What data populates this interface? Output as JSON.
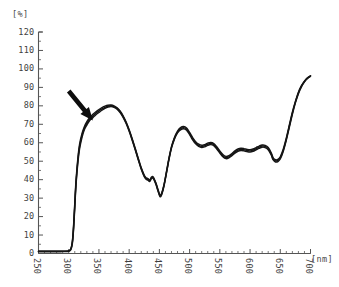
{
  "axes": {
    "y_unit_label": "[%]",
    "x_unit_label": "[nm]",
    "y_ticks": [
      "120",
      "110",
      "100",
      "90",
      "80",
      "70",
      "60",
      "50",
      "40",
      "30",
      "20",
      "10",
      "0"
    ],
    "x_ticks": [
      "250",
      "300",
      "350",
      "400",
      "450",
      "500",
      "550",
      "600",
      "650",
      "700"
    ]
  },
  "annotation": {
    "arrow_name": "down-right-arrow",
    "points_at_nm": 340,
    "points_at_percent": 72
  },
  "style": {
    "curve_color": "#151515",
    "axis_color": "#555555",
    "tick_label_color": "#3f3f3f",
    "background": "#ffffff"
  },
  "chart_data": {
    "type": "line",
    "title": "",
    "subtitle": "",
    "xlabel": "[nm]",
    "ylabel": "[%]",
    "xlim": [
      250,
      700
    ],
    "ylim": [
      0,
      120
    ],
    "grid": false,
    "legend_position": "none",
    "x_major_tick_interval": 50,
    "x_minor_tick_interval": 10,
    "y_major_tick_interval": 10,
    "annotations": [
      {
        "type": "arrow",
        "target_x": 340,
        "target_y": 72,
        "tail_x": 300,
        "tail_y": 88,
        "label": ""
      }
    ],
    "series": [
      {
        "name": "trace-1",
        "x": [
          250,
          260,
          270,
          280,
          290,
          298,
          303,
          306,
          308,
          310,
          312,
          315,
          318,
          322,
          326,
          330,
          335,
          340,
          345,
          350,
          355,
          360,
          365,
          370,
          375,
          380,
          385,
          390,
          395,
          400,
          405,
          410,
          415,
          420,
          425,
          428,
          431,
          434,
          437,
          440,
          444,
          448,
          451,
          454,
          458,
          462,
          466,
          470,
          475,
          480,
          485,
          490,
          495,
          500,
          505,
          510,
          515,
          520,
          525,
          530,
          535,
          540,
          545,
          550,
          555,
          560,
          565,
          570,
          575,
          580,
          585,
          590,
          595,
          600,
          605,
          610,
          615,
          620,
          625,
          630,
          635,
          638,
          642,
          646,
          650,
          655,
          660,
          665,
          670,
          675,
          680,
          685,
          690,
          695,
          700
        ],
        "y": [
          1.2,
          1.2,
          1.2,
          1.2,
          1.2,
          1.3,
          2.0,
          6.0,
          14.0,
          26.0,
          38.0,
          50.0,
          58.0,
          64.0,
          68.0,
          70.5,
          73.0,
          74.5,
          76.0,
          77.2,
          78.3,
          79.2,
          79.8,
          80.0,
          79.6,
          78.6,
          76.8,
          74.2,
          70.8,
          66.6,
          61.8,
          56.6,
          51.2,
          46.0,
          42.0,
          40.6,
          40.2,
          39.4,
          41.0,
          41.0,
          38.0,
          34.0,
          31.2,
          32.5,
          37.5,
          44.5,
          51.5,
          57.5,
          62.5,
          65.8,
          67.6,
          68.2,
          67.4,
          65.0,
          62.2,
          60.0,
          58.6,
          58.0,
          58.4,
          59.2,
          59.6,
          59.0,
          57.2,
          55.0,
          53.0,
          52.0,
          52.4,
          53.6,
          55.0,
          56.0,
          56.4,
          56.2,
          55.8,
          55.6,
          56.0,
          56.8,
          57.6,
          58.2,
          58.0,
          56.8,
          54.0,
          51.4,
          50.2,
          50.4,
          51.8,
          56.0,
          62.0,
          69.0,
          76.0,
          82.0,
          87.0,
          90.6,
          93.2,
          95.0,
          96.2
        ]
      },
      {
        "name": "trace-2",
        "x": [
          250,
          260,
          270,
          280,
          290,
          298,
          303,
          306,
          308,
          310,
          312,
          315,
          318,
          322,
          326,
          330,
          335,
          340,
          345,
          350,
          355,
          360,
          365,
          370,
          375,
          380,
          385,
          390,
          395,
          400,
          405,
          410,
          415,
          420,
          425,
          428,
          431,
          434,
          437,
          440,
          444,
          448,
          451,
          454,
          458,
          462,
          466,
          470,
          475,
          480,
          485,
          490,
          495,
          500,
          505,
          510,
          515,
          520,
          525,
          530,
          535,
          540,
          545,
          550,
          555,
          560,
          565,
          570,
          575,
          580,
          585,
          590,
          595,
          600,
          605,
          610,
          615,
          620,
          625,
          630,
          635,
          638,
          642,
          646,
          650,
          655,
          660,
          665,
          670,
          675,
          680,
          685,
          690,
          695,
          700
        ],
        "y": [
          1.2,
          1.2,
          1.2,
          1.2,
          1.2,
          1.3,
          2.2,
          6.6,
          15.0,
          27.2,
          39.2,
          51.2,
          59.2,
          65.0,
          68.8,
          71.4,
          73.8,
          75.4,
          76.8,
          78.0,
          79.0,
          79.8,
          80.3,
          80.4,
          80.0,
          79.0,
          77.2,
          74.6,
          71.2,
          67.0,
          62.2,
          57.0,
          51.6,
          46.4,
          42.4,
          41.0,
          40.6,
          39.8,
          41.4,
          41.4,
          38.4,
          34.4,
          31.6,
          32.9,
          37.9,
          44.9,
          51.9,
          57.9,
          62.9,
          66.3,
          68.2,
          68.8,
          68.0,
          65.6,
          62.8,
          60.6,
          59.2,
          58.6,
          59.0,
          59.8,
          60.2,
          59.6,
          57.8,
          55.6,
          53.6,
          52.6,
          53.0,
          54.2,
          55.6,
          56.6,
          57.0,
          56.8,
          56.4,
          56.2,
          56.6,
          57.4,
          58.2,
          58.8,
          58.6,
          57.4,
          54.6,
          52.0,
          50.8,
          51.0,
          52.4,
          56.6,
          62.6,
          69.6,
          76.6,
          82.4,
          87.4,
          90.9,
          93.4,
          95.2,
          96.3
        ]
      },
      {
        "name": "trace-3",
        "x": [
          250,
          260,
          270,
          280,
          290,
          298,
          303,
          306,
          308,
          310,
          312,
          315,
          318,
          322,
          326,
          330,
          335,
          340,
          345,
          350,
          355,
          360,
          365,
          370,
          375,
          380,
          385,
          390,
          395,
          400,
          405,
          410,
          415,
          420,
          425,
          428,
          431,
          434,
          437,
          440,
          444,
          448,
          451,
          454,
          458,
          462,
          466,
          470,
          475,
          480,
          485,
          490,
          495,
          500,
          505,
          510,
          515,
          520,
          525,
          530,
          535,
          540,
          545,
          550,
          555,
          560,
          565,
          570,
          575,
          580,
          585,
          590,
          595,
          600,
          605,
          610,
          615,
          620,
          625,
          630,
          635,
          638,
          642,
          646,
          650,
          655,
          660,
          665,
          670,
          675,
          680,
          685,
          690,
          695,
          700
        ],
        "y": [
          1.0,
          1.0,
          1.0,
          1.0,
          1.0,
          1.1,
          1.8,
          5.4,
          13.0,
          24.8,
          36.8,
          48.8,
          56.8,
          63.0,
          67.2,
          69.6,
          72.2,
          73.6,
          75.2,
          76.4,
          77.6,
          78.6,
          79.3,
          79.6,
          79.2,
          78.2,
          76.4,
          73.8,
          70.4,
          66.2,
          61.4,
          56.2,
          50.8,
          45.6,
          41.6,
          40.2,
          39.8,
          39.0,
          40.6,
          40.6,
          37.6,
          33.6,
          30.8,
          32.1,
          37.1,
          44.1,
          51.1,
          57.1,
          62.1,
          65.4,
          67.0,
          67.6,
          66.8,
          64.4,
          61.6,
          59.4,
          58.0,
          57.4,
          57.8,
          58.6,
          59.0,
          58.4,
          56.6,
          54.4,
          52.4,
          51.4,
          51.8,
          53.0,
          54.4,
          55.4,
          55.8,
          55.6,
          55.2,
          55.0,
          55.4,
          56.2,
          57.0,
          57.6,
          57.4,
          56.2,
          53.4,
          50.8,
          49.6,
          49.8,
          51.2,
          55.4,
          61.4,
          68.4,
          75.4,
          81.6,
          86.6,
          90.3,
          93.0,
          94.8,
          96.0
        ]
      }
    ]
  }
}
